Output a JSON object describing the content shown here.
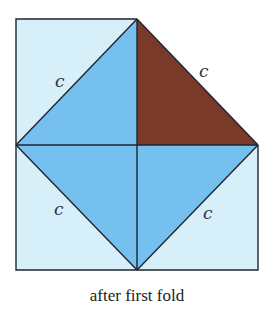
{
  "figure": {
    "caption": "after first fold",
    "labels": {
      "top_left": "c",
      "top_right": "c",
      "bottom_left": "c",
      "bottom_right": "c"
    },
    "colors": {
      "paper_light": "#d6eff9",
      "paper_mid": "#75c0ef",
      "folded_flap": "#7a3a2a",
      "line": "#1f2530"
    }
  }
}
